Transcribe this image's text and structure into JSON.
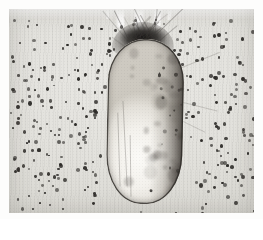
{
  "figure": {
    "modality": "brightfield-light-microscopy",
    "staining": "hematoxylin-like grayscale",
    "orientation": "hair follicle oriented vertically, epidermal surface at top",
    "caption": "",
    "background_color": "#e4e3de",
    "tissue_color": "#e2e1dc",
    "nucleus_color": "#2c2a27",
    "pigment_color": "#2d2a27",
    "bulb_lumen_color": "#fbfaf7",
    "border_color": "#ffffff"
  },
  "structures": [
    {
      "name": "dermal-stroma",
      "label": "Dermal connective tissue with scattered nuclei",
      "region": "full-field background",
      "tone": "light gray, fine vertical fiber striations"
    },
    {
      "name": "epidermal-surface-clefts",
      "label": "White clefts at upper tissue margin",
      "region": "top center, three vertical slits",
      "tone": "white separations between tissue segments"
    },
    {
      "name": "follicular-neck-cap",
      "label": "Dark fibrous / pigmented follicular cap",
      "region": "top of bulb, x 103-165, y 13-49",
      "tone": "dense dark brown-black"
    },
    {
      "name": "hair-bulb",
      "label": "Elongated pear-shaped hair bulb",
      "region": "center, x 98-174, y 30-195",
      "tone": "bright pale interior, dark outline"
    },
    {
      "name": "pigmented-flank",
      "label": "Pigmented right flank of the bulb",
      "region": "right side of bulb",
      "tone": "dark mottled gray-brown"
    },
    {
      "name": "inner-cleft",
      "label": "Pale inner cleft line along left side of bulb",
      "region": "left inner margin of bulb",
      "tone": "thin gray line"
    }
  ],
  "nuclei": {
    "description": "Small round dark nuclei scattered throughout the dermal stroma",
    "approximate_count": 320,
    "diameter_px": [
      2,
      4
    ],
    "color": "#2c2a27"
  },
  "frame": {
    "margin_px": 9,
    "width_px": 263,
    "height_px": 219
  }
}
